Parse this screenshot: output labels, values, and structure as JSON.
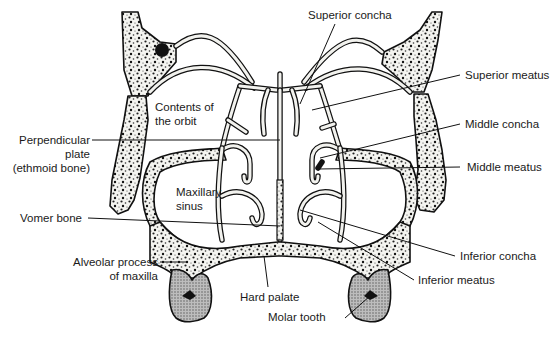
{
  "diagram": {
    "type": "anatomical illustration",
    "labels": {
      "superior_concha": "Superior concha",
      "superior_meatus": "Superior meatus",
      "middle_concha": "Middle concha",
      "middle_meatus": "Middle meatus",
      "inferior_concha": "Inferior concha",
      "inferior_meatus": "Inferior meatus",
      "molar_tooth": "Molar tooth",
      "hard_palate": "Hard palate",
      "contents_orbit_1": "Contents of",
      "contents_orbit_2": "the orbit",
      "maxillary_sinus_1": "Maxillary",
      "maxillary_sinus_2": "sinus",
      "perpendicular_plate_1": "Perpendicular",
      "perpendicular_plate_2": "plate",
      "perpendicular_plate_3": "(ethmoid bone)",
      "vomer_bone": "Vomer bone",
      "alveolar_process_1": "Alveolar process",
      "alveolar_process_2": "of maxilla"
    },
    "colors": {
      "ink": "#111111",
      "background": "#ffffff"
    }
  }
}
